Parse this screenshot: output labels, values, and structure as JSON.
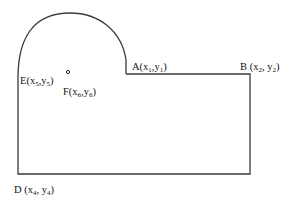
{
  "diagram": {
    "type": "geometric-outline",
    "stroke_color": "#3a3a3a",
    "labels": {
      "A": {
        "letter": "A",
        "open": "(",
        "x": "x",
        "x_sub": "1",
        "comma": ",",
        "y": "y",
        "y_sub": "1",
        "close": ")"
      },
      "B": {
        "letter": "B ",
        "open": "(",
        "x": "x",
        "x_sub": "2",
        "comma": ", ",
        "y": "y",
        "y_sub": "2",
        "close": ")"
      },
      "D": {
        "letter": "D ",
        "open": "(",
        "x": "x",
        "x_sub": "4",
        "comma": ", ",
        "y": "y",
        "y_sub": "4",
        "close": ")"
      },
      "E": {
        "letter": "E",
        "open": "(",
        "x": "x",
        "x_sub": "5",
        "comma": ",",
        "y": "y",
        "y_sub": "5",
        "close": ")"
      },
      "F": {
        "letter": "F",
        "open": "(",
        "x": "x",
        "x_sub": "6",
        "comma": ",",
        "y": "y",
        "y_sub": "6",
        "close": ")"
      }
    }
  }
}
